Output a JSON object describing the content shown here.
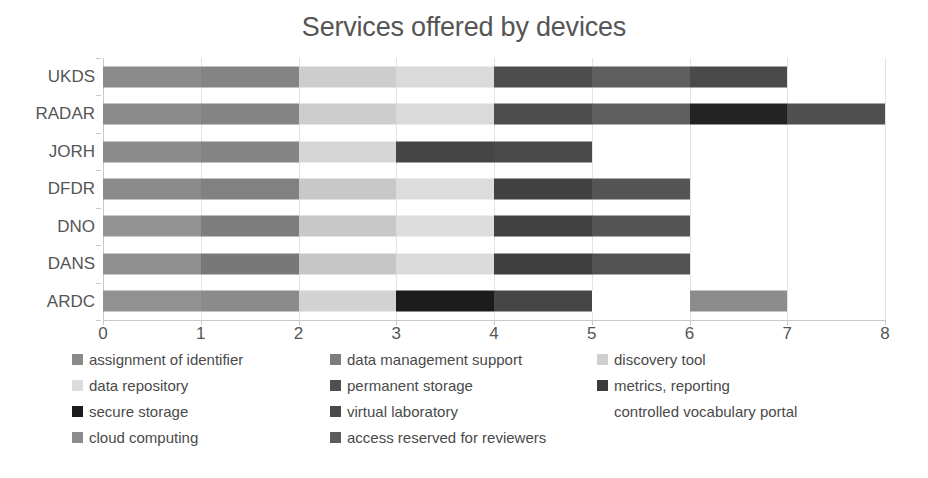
{
  "chart_data": {
    "type": "bar",
    "orientation": "horizontal",
    "stacked": true,
    "title": "Services offered by devices",
    "xlabel": "",
    "ylabel": "",
    "xlim": [
      0,
      8
    ],
    "xticks": [
      0,
      1,
      2,
      3,
      4,
      5,
      6,
      7,
      8
    ],
    "grid": true,
    "grid_axis": "x",
    "legend_position": "bottom",
    "legend_columns": 3,
    "categories": [
      "UKDS",
      "RADAR",
      "JORH",
      "DFDR",
      "DNO",
      "DANS",
      "ARDC"
    ],
    "series": [
      {
        "name": "assignment of identifier",
        "color": "#8a8a8a",
        "values": [
          1,
          1,
          1,
          1,
          1,
          1,
          1
        ]
      },
      {
        "name": "data management support",
        "color": "#7d7d7d",
        "values": [
          1,
          1,
          1,
          1,
          1,
          1,
          1
        ]
      },
      {
        "name": "discovery tool",
        "color": "#cfcfcf",
        "values": [
          1,
          1,
          1,
          1,
          1,
          1,
          1
        ]
      },
      {
        "name": "data repository",
        "color": "#dcdcdc",
        "values": [
          1,
          1,
          0,
          1,
          1,
          1,
          1
        ]
      },
      {
        "name": "permanent storage",
        "color": "#4f4f4f",
        "values": [
          1,
          1,
          0,
          1,
          1,
          1,
          0
        ]
      },
      {
        "name": "metrics, reporting",
        "color": "#585858",
        "values": [
          1,
          1,
          1,
          1,
          1,
          1,
          0
        ]
      },
      {
        "name": "secure storage",
        "color": "#1c1c1c",
        "values": [
          0,
          0,
          1,
          0,
          0,
          0,
          1
        ]
      },
      {
        "name": "virtual laboratory",
        "color": "#4a4a4a",
        "values": [
          1,
          1,
          0,
          0,
          0,
          0,
          1
        ]
      },
      {
        "name": "controlled vocabulary portal",
        "color": "#ffffff",
        "values": [
          0,
          0,
          0,
          0,
          0,
          0,
          1
        ]
      },
      {
        "name": "cloud computing",
        "color": "#8c8c8c",
        "values": [
          0,
          0,
          0,
          0,
          0,
          0,
          1
        ]
      },
      {
        "name": "access reserved for reviewers",
        "color": "#5c5c5c",
        "values": [
          0,
          2,
          0,
          0,
          0,
          0,
          0
        ]
      }
    ],
    "bar_totals": [
      7,
      8,
      5,
      6,
      6,
      6,
      7
    ],
    "bars": [
      {
        "category": "UKDS",
        "total": 7,
        "segments": [
          {
            "label": "assignment of identifier",
            "start": 0,
            "end": 1,
            "color": "#8a8a8a"
          },
          {
            "label": "data management support",
            "start": 1,
            "end": 2,
            "color": "#848484"
          },
          {
            "label": "discovery tool",
            "start": 2,
            "end": 3,
            "color": "#cdcdcd"
          },
          {
            "label": "data repository",
            "start": 3,
            "end": 4,
            "color": "#dadada"
          },
          {
            "label": "permanent storage",
            "start": 4,
            "end": 5,
            "color": "#4d4d4d"
          },
          {
            "label": "metrics, reporting",
            "start": 5,
            "end": 6,
            "color": "#5e5e5e"
          },
          {
            "label": "virtual laboratory",
            "start": 6,
            "end": 7,
            "color": "#4a4a4a"
          }
        ]
      },
      {
        "category": "RADAR",
        "total": 8,
        "segments": [
          {
            "label": "assignment of identifier",
            "start": 0,
            "end": 1,
            "color": "#8a8a8a"
          },
          {
            "label": "data management support",
            "start": 1,
            "end": 2,
            "color": "#848484"
          },
          {
            "label": "discovery tool",
            "start": 2,
            "end": 3,
            "color": "#cdcdcd"
          },
          {
            "label": "data repository",
            "start": 3,
            "end": 4,
            "color": "#dadada"
          },
          {
            "label": "permanent storage",
            "start": 4,
            "end": 5,
            "color": "#4d4d4d"
          },
          {
            "label": "metrics, reporting",
            "start": 5,
            "end": 6,
            "color": "#5e5e5e"
          },
          {
            "label": "secure storage",
            "start": 6,
            "end": 7,
            "color": "#232323"
          },
          {
            "label": "virtual laboratory",
            "start": 7,
            "end": 8,
            "color": "#4f4f4f"
          }
        ]
      },
      {
        "category": "JORH",
        "total": 5,
        "segments": [
          {
            "label": "assignment of identifier",
            "start": 0,
            "end": 1,
            "color": "#8a8a8a"
          },
          {
            "label": "data management support",
            "start": 1,
            "end": 2,
            "color": "#848484"
          },
          {
            "label": "discovery tool",
            "start": 2,
            "end": 3,
            "color": "#d6d6d6"
          },
          {
            "label": "secure storage",
            "start": 3,
            "end": 4,
            "color": "#454545"
          },
          {
            "label": "metrics, reporting",
            "start": 4,
            "end": 5,
            "color": "#4a4a4a"
          }
        ]
      },
      {
        "category": "DFDR",
        "total": 6,
        "segments": [
          {
            "label": "assignment of identifier",
            "start": 0,
            "end": 1,
            "color": "#8a8a8a"
          },
          {
            "label": "data management support",
            "start": 1,
            "end": 2,
            "color": "#818181"
          },
          {
            "label": "discovery tool",
            "start": 2,
            "end": 3,
            "color": "#c8c8c8"
          },
          {
            "label": "data repository",
            "start": 3,
            "end": 4,
            "color": "#dcdcdc"
          },
          {
            "label": "permanent storage",
            "start": 4,
            "end": 5,
            "color": "#414141"
          },
          {
            "label": "metrics, reporting",
            "start": 5,
            "end": 6,
            "color": "#555555"
          }
        ]
      },
      {
        "category": "DNO",
        "total": 6,
        "segments": [
          {
            "label": "assignment of identifier",
            "start": 0,
            "end": 1,
            "color": "#939393"
          },
          {
            "label": "data management support",
            "start": 1,
            "end": 2,
            "color": "#7d7d7d"
          },
          {
            "label": "discovery tool",
            "start": 2,
            "end": 3,
            "color": "#c8c8c8"
          },
          {
            "label": "data repository",
            "start": 3,
            "end": 4,
            "color": "#dddddd"
          },
          {
            "label": "permanent storage",
            "start": 4,
            "end": 5,
            "color": "#414141"
          },
          {
            "label": "metrics, reporting",
            "start": 5,
            "end": 6,
            "color": "#555555"
          }
        ]
      },
      {
        "category": "DANS",
        "total": 6,
        "segments": [
          {
            "label": "assignment of identifier",
            "start": 0,
            "end": 1,
            "color": "#8f8f8f"
          },
          {
            "label": "data management support",
            "start": 1,
            "end": 2,
            "color": "#787878"
          },
          {
            "label": "discovery tool",
            "start": 2,
            "end": 3,
            "color": "#c6c6c6"
          },
          {
            "label": "data repository",
            "start": 3,
            "end": 4,
            "color": "#dbdbdb"
          },
          {
            "label": "permanent storage",
            "start": 4,
            "end": 5,
            "color": "#3f3f3f"
          },
          {
            "label": "metrics, reporting",
            "start": 5,
            "end": 6,
            "color": "#525252"
          }
        ]
      },
      {
        "category": "ARDC",
        "total": 7,
        "segments": [
          {
            "label": "assignment of identifier",
            "start": 0,
            "end": 1,
            "color": "#919191"
          },
          {
            "label": "data management support",
            "start": 1,
            "end": 2,
            "color": "#8b8b8b"
          },
          {
            "label": "discovery tool",
            "start": 2,
            "end": 3,
            "color": "#d2d2d2"
          },
          {
            "label": "secure storage",
            "start": 3,
            "end": 4,
            "color": "#1c1c1c"
          },
          {
            "label": "virtual laboratory",
            "start": 4,
            "end": 5,
            "color": "#464646"
          },
          {
            "label": "controlled vocabulary portal",
            "start": 5,
            "end": 6,
            "color": "#ffffff"
          },
          {
            "label": "cloud computing",
            "start": 6,
            "end": 7,
            "color": "#8c8c8c"
          }
        ]
      }
    ],
    "legend": [
      {
        "label": "assignment of identifier",
        "color": "#8a8a8a",
        "col": 0,
        "row": 0
      },
      {
        "label": "data management support",
        "color": "#7d7d7d",
        "col": 1,
        "row": 0
      },
      {
        "label": "discovery tool",
        "color": "#cfcfcf",
        "col": 2,
        "row": 0
      },
      {
        "label": "data repository",
        "color": "#dcdcdc",
        "col": 0,
        "row": 1
      },
      {
        "label": "permanent storage",
        "color": "#4f4f4f",
        "col": 1,
        "row": 1
      },
      {
        "label": "metrics, reporting",
        "color": "#3b3b3b",
        "col": 2,
        "row": 1
      },
      {
        "label": "secure storage",
        "color": "#1c1c1c",
        "col": 0,
        "row": 2
      },
      {
        "label": "virtual laboratory",
        "color": "#4a4a4a",
        "col": 1,
        "row": 2
      },
      {
        "label": "controlled vocabulary portal",
        "color": "#ffffff",
        "col": 2,
        "row": 2
      },
      {
        "label": "cloud computing",
        "color": "#8c8c8c",
        "col": 0,
        "row": 3
      },
      {
        "label": "access reserved for reviewers",
        "color": "#5c5c5c",
        "col": 1,
        "row": 3
      }
    ]
  }
}
